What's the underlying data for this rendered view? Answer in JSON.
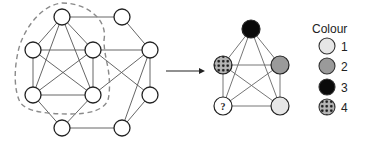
{
  "diagram": {
    "type": "graph-coloring-illustration",
    "left_graph": {
      "node_radius": 8,
      "nodes": [
        {
          "id": "A",
          "x": 62,
          "y": 17
        },
        {
          "id": "B",
          "x": 122,
          "y": 17
        },
        {
          "id": "C",
          "x": 33,
          "y": 50
        },
        {
          "id": "D",
          "x": 93,
          "y": 50
        },
        {
          "id": "E",
          "x": 150,
          "y": 50
        },
        {
          "id": "F",
          "x": 33,
          "y": 95
        },
        {
          "id": "G",
          "x": 93,
          "y": 95
        },
        {
          "id": "H",
          "x": 150,
          "y": 95
        },
        {
          "id": "I",
          "x": 62,
          "y": 128
        },
        {
          "id": "J",
          "x": 122,
          "y": 128
        }
      ],
      "edges": [
        [
          "A",
          "B"
        ],
        [
          "A",
          "C"
        ],
        [
          "A",
          "D"
        ],
        [
          "A",
          "F"
        ],
        [
          "A",
          "G"
        ],
        [
          "B",
          "E"
        ],
        [
          "C",
          "D"
        ],
        [
          "C",
          "F"
        ],
        [
          "C",
          "G"
        ],
        [
          "D",
          "F"
        ],
        [
          "D",
          "G"
        ],
        [
          "D",
          "E"
        ],
        [
          "D",
          "H"
        ],
        [
          "G",
          "E"
        ],
        [
          "F",
          "G"
        ],
        [
          "E",
          "H"
        ],
        [
          "E",
          "J"
        ],
        [
          "H",
          "J"
        ],
        [
          "F",
          "I"
        ],
        [
          "G",
          "I"
        ],
        [
          "I",
          "J"
        ]
      ],
      "highlighted_subgraph": [
        "A",
        "C",
        "D",
        "F",
        "G"
      ],
      "highlight_style": "dashed-outline"
    },
    "arrow": {
      "x1": 166,
      "y1": 71,
      "x2": 205,
      "y2": 71
    },
    "right_graph": {
      "node_radius": 9,
      "nodes": [
        {
          "id": "top",
          "x": 251,
          "y": 29,
          "colour": 3
        },
        {
          "id": "left",
          "x": 223,
          "y": 65,
          "colour": 4
        },
        {
          "id": "right",
          "x": 280,
          "y": 65,
          "colour": 2
        },
        {
          "id": "bottom-left",
          "x": 223,
          "y": 106,
          "colour": null,
          "label": "?"
        },
        {
          "id": "bottom-right",
          "x": 280,
          "y": 106,
          "colour": 1
        }
      ],
      "edges": [
        [
          "top",
          "left"
        ],
        [
          "top",
          "right"
        ],
        [
          "top",
          "bottom-left"
        ],
        [
          "top",
          "bottom-right"
        ],
        [
          "left",
          "right"
        ],
        [
          "left",
          "bottom-left"
        ],
        [
          "left",
          "bottom-right"
        ],
        [
          "right",
          "bottom-left"
        ],
        [
          "right",
          "bottom-right"
        ],
        [
          "bottom-left",
          "bottom-right"
        ]
      ]
    },
    "legend": {
      "title": "Colour",
      "items": [
        {
          "label": "1",
          "fill": "#e6e6e6",
          "pattern": "solid"
        },
        {
          "label": "2",
          "fill": "#9a9a9a",
          "pattern": "solid"
        },
        {
          "label": "3",
          "fill": "#0a0a0a",
          "pattern": "solid"
        },
        {
          "label": "4",
          "fill": "#b5b5b5",
          "pattern": "dots"
        }
      ]
    },
    "unknown_label": "?"
  }
}
